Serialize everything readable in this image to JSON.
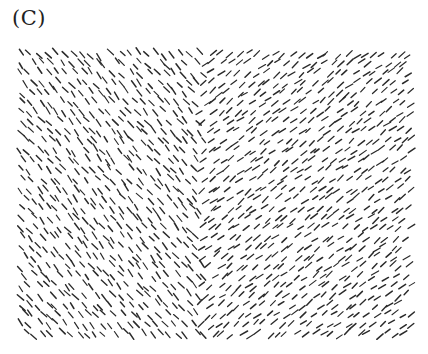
{
  "figure": {
    "panel_label": "(C)",
    "field": {
      "x0": 20,
      "y0": 54,
      "x1": 410,
      "y1": 334
    },
    "grid": {
      "cols": 44,
      "rows": 30
    },
    "boundary_x": 200,
    "regions": [
      {
        "name": "left-texture",
        "orientation_deg": 50,
        "direction": "down-right"
      },
      {
        "name": "right-texture",
        "orientation_deg": -38,
        "direction": "up-right"
      }
    ],
    "segment_length": 7,
    "stroke_color": "#2a2a2a",
    "jitter": 3.2,
    "orientation_jitter_deg": 10,
    "seed": 1234
  }
}
